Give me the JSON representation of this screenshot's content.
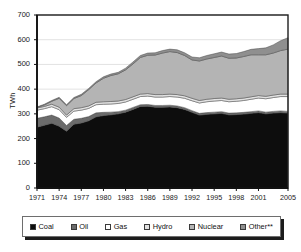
{
  "chart_data": {
    "type": "area",
    "stacked": true,
    "title": "",
    "subtitle": "",
    "xlabel": "",
    "ylabel": "TWh",
    "ylim": [
      0,
      700
    ],
    "yticks": [
      0,
      100,
      200,
      300,
      400,
      500,
      600,
      700
    ],
    "xlim": [
      1971,
      2005
    ],
    "xticks": [
      1971,
      1974,
      1977,
      1980,
      1983,
      1986,
      1989,
      1992,
      1995,
      1998,
      2001,
      2005
    ],
    "grid": "horizontal",
    "legend_position": "bottom",
    "x": [
      1971,
      1972,
      1973,
      1974,
      1975,
      1976,
      1977,
      1978,
      1979,
      1980,
      1981,
      1982,
      1983,
      1984,
      1985,
      1986,
      1987,
      1988,
      1989,
      1990,
      1991,
      1992,
      1993,
      1994,
      1995,
      1996,
      1997,
      1998,
      1999,
      2000,
      2001,
      2002,
      2003,
      2004,
      2005
    ],
    "series": [
      {
        "name": "Coal",
        "color": "#0d0d0d",
        "values": [
          246,
          254,
          262,
          250,
          230,
          258,
          263,
          272,
          288,
          293,
          296,
          300,
          307,
          318,
          330,
          331,
          327,
          327,
          328,
          325,
          318,
          306,
          295,
          298,
          300,
          302,
          296,
          297,
          299,
          302,
          305,
          300,
          303,
          305,
          303
        ]
      },
      {
        "name": "Oil",
        "color": "#6b6b6b",
        "values": [
          36,
          34,
          33,
          33,
          23,
          20,
          19,
          17,
          16,
          13,
          11,
          9,
          8,
          8,
          7,
          7,
          7,
          7,
          7,
          7,
          7,
          7,
          7,
          7,
          7,
          7,
          7,
          7,
          7,
          7,
          7,
          7,
          7,
          7,
          7
        ]
      },
      {
        "name": "Gas",
        "color": "#ffffff",
        "values": [
          33,
          33,
          34,
          34,
          33,
          33,
          33,
          33,
          33,
          33,
          33,
          33,
          33,
          33,
          33,
          34,
          34,
          34,
          35,
          36,
          38,
          40,
          42,
          44,
          45,
          45,
          46,
          47,
          48,
          50,
          52,
          54,
          56,
          58,
          60
        ]
      },
      {
        "name": "Hydro",
        "color": "#e2e2e2",
        "values": [
          9,
          9,
          10,
          10,
          9,
          10,
          10,
          10,
          10,
          10,
          10,
          10,
          10,
          10,
          10,
          10,
          10,
          10,
          10,
          10,
          10,
          10,
          10,
          10,
          10,
          10,
          10,
          10,
          10,
          10,
          10,
          10,
          10,
          10,
          10
        ]
      },
      {
        "name": "Nuclear",
        "color": "#b4b4b4",
        "values": [
          2,
          6,
          12,
          36,
          38,
          41,
          49,
          66,
          78,
          95,
          105,
          110,
          120,
          133,
          148,
          155,
          160,
          168,
          172,
          170,
          163,
          155,
          160,
          163,
          166,
          170,
          166,
          165,
          168,
          170,
          165,
          168,
          170,
          176,
          182
        ]
      },
      {
        "name": "Other**",
        "color": "#8f8f8f",
        "values": [
          2,
          3,
          3,
          4,
          4,
          4,
          5,
          5,
          5,
          6,
          6,
          6,
          7,
          8,
          8,
          9,
          9,
          10,
          10,
          11,
          11,
          12,
          13,
          14,
          15,
          16,
          17,
          18,
          20,
          22,
          25,
          28,
          33,
          40,
          46
        ]
      }
    ]
  },
  "axes": {
    "ytick_labels": [
      "700",
      "600",
      "500",
      "400",
      "300",
      "200",
      "100",
      "0"
    ],
    "xtick_labels": [
      "1971",
      "1974",
      "1977",
      "1980",
      "1983",
      "1986",
      "1989",
      "1992",
      "1995",
      "1998",
      "2001",
      "2005"
    ],
    "ylabel": "TWh"
  },
  "legend": {
    "items": [
      {
        "label": "Coal",
        "color": "#0d0d0d"
      },
      {
        "label": "Oil",
        "color": "#6b6b6b"
      },
      {
        "label": "Gas",
        "color": "#ffffff"
      },
      {
        "label": "Hydro",
        "color": "#e2e2e2"
      },
      {
        "label": "Nuclear",
        "color": "#b4b4b4"
      },
      {
        "label": "Other**",
        "color": "#8f8f8f"
      }
    ]
  }
}
